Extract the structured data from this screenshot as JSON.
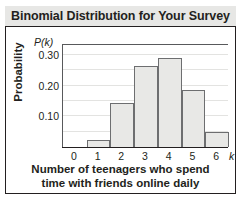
{
  "card": {
    "title": "Binomial Distribution for Your Survey"
  },
  "chart_data": {
    "type": "bar",
    "title": "Binomial Distribution for Your Survey",
    "xlabel": "Number of teenagers who spend time with friends online daily",
    "xlabel_line1": "Number of teenagers who spend",
    "xlabel_line2": "time with friends online daily",
    "ylabel": "Probability",
    "y_axis_symbol": "P(k)",
    "x_axis_symbol": "k",
    "categories": [
      "0",
      "1",
      "2",
      "3",
      "4",
      "5",
      "6"
    ],
    "values": [
      0.0,
      0.023,
      0.142,
      0.265,
      0.29,
      0.185,
      0.05
    ],
    "xtick_labels": [
      "0",
      "1",
      "2",
      "3",
      "4",
      "5",
      "6"
    ],
    "ytick_labels": [
      "0.30",
      "0.20",
      "0.10"
    ],
    "ytick_values": [
      0.3,
      0.2,
      0.1
    ],
    "ylim": [
      0,
      0.335
    ],
    "xlim": [
      -0.5,
      6.5
    ],
    "grid": true,
    "grid_step": 0.05,
    "legend": "none",
    "bar_fill_color": "#e8e8e6",
    "bar_border_color": "#6d6e70",
    "axis_color": "#231f20",
    "grid_color": "#e3e3e1",
    "title_bar_color": "#e7e7e5"
  }
}
